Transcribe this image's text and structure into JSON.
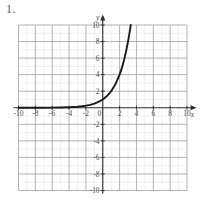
{
  "problem": {
    "number": "1."
  },
  "chart_data": {
    "type": "line",
    "title": "",
    "subtitle": "",
    "xlabel": "x",
    "ylabel": "y",
    "xlim": [
      -10,
      10
    ],
    "ylim": [
      -10,
      10
    ],
    "grid": true,
    "minor_grid_step": 1,
    "major_grid_step": 2,
    "legend": "none",
    "x_ticks": [
      -10,
      -8,
      -6,
      -4,
      -2,
      0,
      2,
      4,
      6,
      8,
      10
    ],
    "x_tick_labels": [
      "-10",
      "-8",
      "-6",
      "-4",
      "-2",
      "0",
      "2",
      "4",
      "6",
      "8",
      "10"
    ],
    "y_ticks": [
      10,
      8,
      6,
      4,
      2,
      0,
      -2,
      -4,
      -6,
      -8,
      -10
    ],
    "y_tick_labels": [
      "10",
      "8",
      "6",
      "4",
      "2",
      "0",
      "-2",
      "-4",
      "-6",
      "-8",
      "-10"
    ],
    "origin_label": "0",
    "series": [
      {
        "name": "exponential-curve",
        "equation": "y = 2^x",
        "color": "#1a1a1a",
        "line_width": 1.9,
        "asymptote_y": 0,
        "x": [
          -10,
          -9,
          -8,
          -7,
          -6,
          -5,
          -4,
          -3.5,
          -3,
          -2.5,
          -2,
          -1.5,
          -1,
          -0.5,
          0,
          0.5,
          1,
          1.5,
          2,
          2.25,
          2.5,
          2.75,
          3,
          3.1,
          3.2,
          3.3219
        ],
        "values": [
          0.0009765625,
          0.001953125,
          0.00390625,
          0.0078125,
          0.015625,
          0.03125,
          0.0625,
          0.088388,
          0.125,
          0.176777,
          0.25,
          0.353553,
          0.5,
          0.707107,
          1,
          1.414214,
          2,
          2.828427,
          4,
          4.756828,
          5.656854,
          6.727171,
          8,
          8.574188,
          9.189587,
          10
        ]
      }
    ],
    "annotations": [
      {
        "name": "x-axis-arrow",
        "position": "right-end-of-x-axis"
      },
      {
        "name": "y-axis-arrow",
        "position": "top-end-of-y-axis"
      }
    ],
    "colors": {
      "curve": "#1a1a1a",
      "axis": "#2b2b2b",
      "major_grid": "#9a9a9a",
      "minor_grid": "#c4c4c4",
      "background": "#ffffff",
      "tick_text": "#4a4a4a"
    }
  }
}
